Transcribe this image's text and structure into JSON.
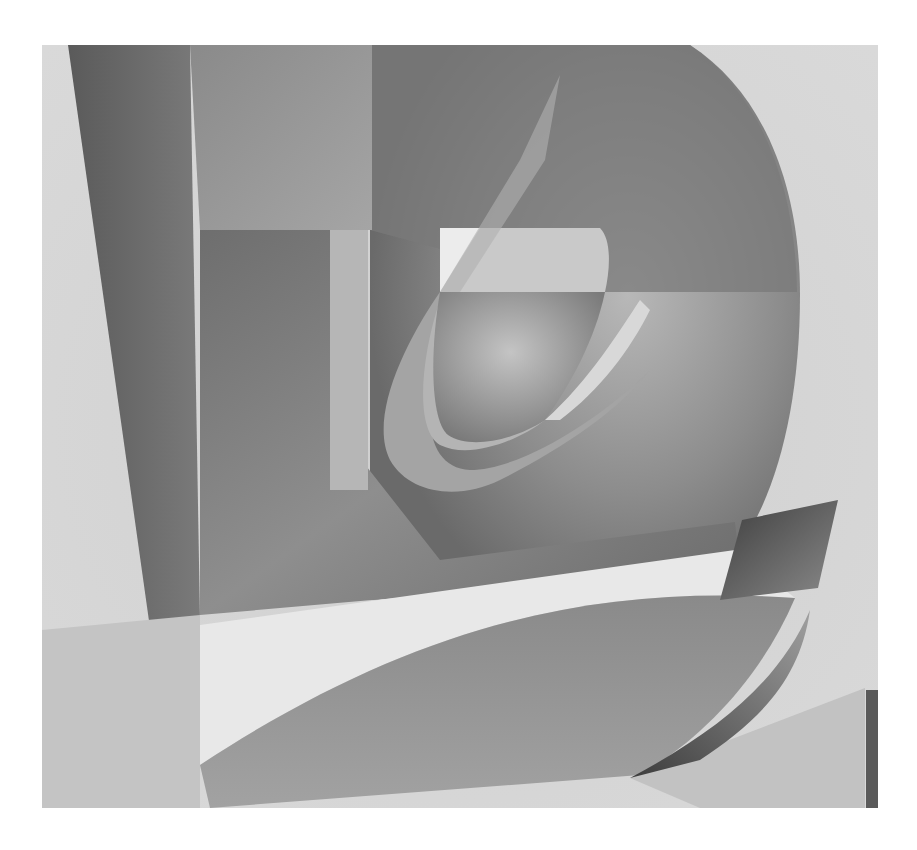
{
  "image": {
    "kind": "abstract painting",
    "palette": "grayscale",
    "background": "#ffffff",
    "canvas": {
      "x": 42,
      "y": 45,
      "width": 836,
      "height": 763
    },
    "tones": {
      "light": "#d6d6d6",
      "pale": "#e6e6e6",
      "mid": "#9a9a9a",
      "mid_dark": "#7e7e7e",
      "dark": "#5e5e5e",
      "deep": "#4a4a4a"
    }
  }
}
